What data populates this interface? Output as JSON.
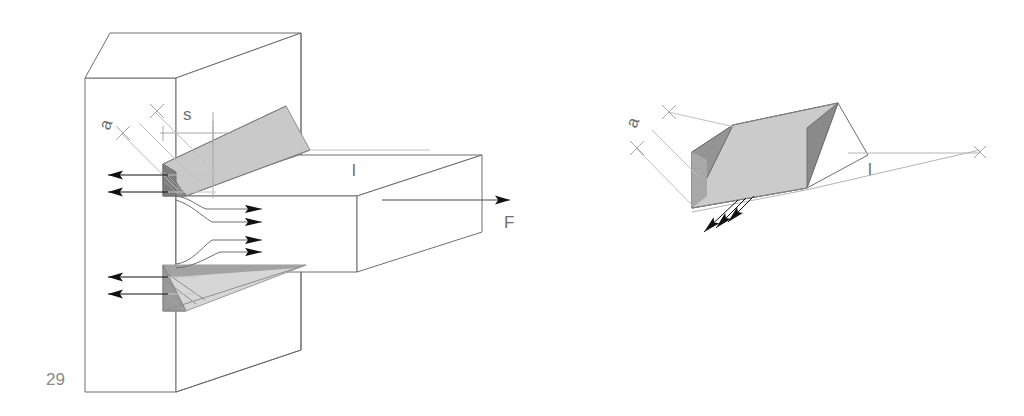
{
  "figure": {
    "page_number": "29",
    "background_color": "#ffffff",
    "line_color": "#6e6e6e",
    "edge_color": "#4a4a4a",
    "arrow_color": "#111111",
    "weld_face_color": "#c9c9c9",
    "weld_side_color": "#9a9a9a",
    "weld_dark_color": "#7d7d7d",
    "weld_light_color": "#d6d6d6",
    "thin_line_color": "#b4b4b4"
  },
  "left_view": {
    "name": "double-fillet-weld-tee-joint",
    "labels": {
      "throat": "a",
      "leg": "s",
      "length": "l",
      "force": "F"
    }
  },
  "right_view": {
    "name": "isolated-fillet-weld-prism",
    "labels": {
      "throat": "a",
      "length": "l"
    }
  },
  "annotations": {
    "a_description": "a",
    "s_description": "s",
    "l_description": "l",
    "F_description": "F"
  }
}
